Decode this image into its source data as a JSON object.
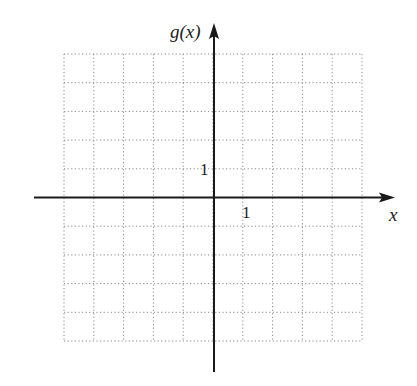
{
  "chart_data": {
    "type": "line",
    "title": "",
    "xlabel": "x",
    "ylabel": "g(x)",
    "xlim": [
      -5,
      5
    ],
    "ylim": [
      -5,
      5
    ],
    "grid": true,
    "grid_style": "dotted",
    "tick_labels": {
      "x": [
        "1"
      ],
      "y": [
        "1"
      ]
    },
    "series": [],
    "legend": null
  },
  "labels": {
    "y_axis": "g(x)",
    "x_axis": "x",
    "x_unit_tick": "1",
    "y_unit_tick": "1"
  },
  "colors": {
    "axis": "#1a1a1a",
    "grid": "#8a8a8a",
    "background": "#ffffff"
  }
}
